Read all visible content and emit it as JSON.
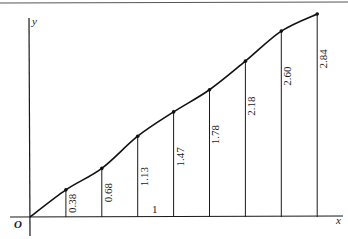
{
  "chart_data": {
    "type": "line",
    "title": "",
    "xlabel": "x",
    "ylabel": "y",
    "origin_label": "O",
    "interval_label": "1",
    "x": [
      0,
      1,
      2,
      3,
      4,
      5,
      6,
      7,
      8
    ],
    "values": [
      0,
      0.38,
      0.68,
      1.13,
      1.47,
      1.78,
      2.18,
      2.6,
      2.84
    ],
    "ordinate_labels": [
      "0.38",
      "0.68",
      "1.13",
      "1.47",
      "1.78",
      "2.18",
      "2.60",
      "2.84"
    ],
    "ylim": [
      0,
      2.9
    ],
    "xlim": [
      0,
      8.6
    ],
    "grid": false,
    "legend": null,
    "annotations": [
      "Vertical ordinates drawn at each unit x with their heights labelled rotated along the line",
      "Width of one interval labelled 1"
    ]
  },
  "colors": {
    "ink": "#1a1a1a",
    "background": "#ffffff"
  }
}
